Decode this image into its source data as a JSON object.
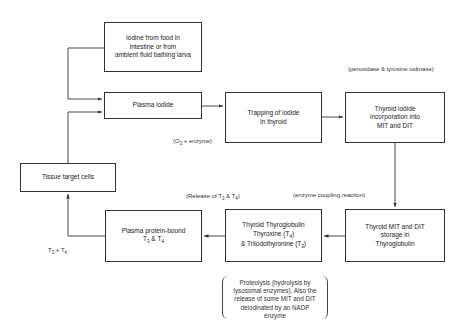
{
  "diagram": {
    "type": "flowchart",
    "nodes": {
      "iodine_source": {
        "lines": [
          "Iodine from food in",
          "intestine or from",
          "ambient fluid bathing larva"
        ]
      },
      "plasma_iodide": {
        "lines": [
          "Plasma iodide"
        ]
      },
      "trapping": {
        "lines": [
          "Trapping of iodide",
          "in thyroid"
        ]
      },
      "incorporation": {
        "lines": [
          "Thyroid iodide",
          "incorporation into",
          "MIT and DIT"
        ]
      },
      "tissue_target": {
        "lines": [
          "Tissue target cells"
        ]
      },
      "plasma_protein": {
        "line1": "Plasma protein-bound",
        "t": "T",
        "s1": "3",
        "amp": " & ",
        "t2": "T",
        "s2": "4"
      },
      "thyroglobulin": {
        "line1": "Thyroid Thyroglobulin",
        "line2a": "Thyroxine (T",
        "line2s": "4",
        "line2b": ")",
        "line3a": "& Triiodothyronine (T",
        "line3s": "3",
        "line3b": ")"
      },
      "storage": {
        "lines": [
          "Thyroid MIT and DIT",
          "storage in",
          "Thyroglobulin"
        ]
      }
    },
    "labels": {
      "peroxidase": "(peroxidase & tyrosine iodinase)",
      "o2_enzyme_a": "(O",
      "o2_enzyme_sub": "2",
      "o2_enzyme_b": " + enzyme)",
      "release_a": "(Release of T",
      "release_s1": "3",
      "release_b": " & T",
      "release_s2": "4",
      "release_c": ")",
      "coupling": "(enzyme coupling reaction)",
      "t3t4_a": "T",
      "t3t4_s1": "3",
      "t3t4_b": " + T",
      "t3t4_s2": "4"
    },
    "brace_note": {
      "lines": [
        "Proteolysis (hydrolysis by",
        "lysosomal enzymes). Also the",
        "release of some MIT and DIT",
        "deiodinated by an NADP enzyme"
      ]
    },
    "edges": [
      {
        "from": "iodine_source",
        "to": "plasma_iodide"
      },
      {
        "from": "tissue_target",
        "to": "plasma_iodide"
      },
      {
        "from": "plasma_iodide",
        "to": "trapping"
      },
      {
        "from": "trapping",
        "to": "incorporation"
      },
      {
        "from": "incorporation",
        "to": "storage"
      },
      {
        "from": "storage",
        "to": "thyroglobulin"
      },
      {
        "from": "thyroglobulin",
        "to": "plasma_protein"
      },
      {
        "from": "plasma_protein",
        "to": "tissue_target"
      }
    ]
  }
}
